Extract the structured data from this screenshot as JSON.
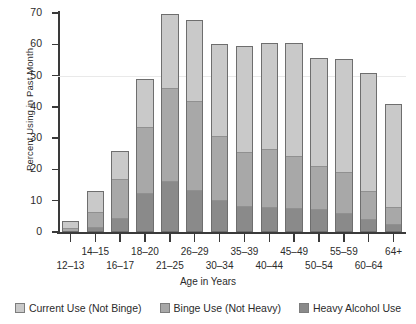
{
  "chart_data": {
    "type": "bar",
    "stacked": true,
    "title": "",
    "xlabel": "Age in Years",
    "ylabel": "Percent Using in Past Month",
    "ylim": [
      0,
      70
    ],
    "yticks": [
      0,
      10,
      20,
      30,
      40,
      50,
      60,
      70
    ],
    "grid": "horizontal gridline at 50",
    "legend_position": "bottom",
    "categories": [
      "12–13",
      "14–15",
      "16–17",
      "18–20",
      "21–25",
      "26–29",
      "30–34",
      "35–39",
      "40–44",
      "45–49",
      "50–54",
      "55–59",
      "60–64",
      "64+"
    ],
    "series": [
      {
        "name": "Heavy Alcohol Use",
        "color": "#8a8a8a",
        "values": [
          0.0,
          1.5,
          4.3,
          12.2,
          16.0,
          13.2,
          10.0,
          8.0,
          7.7,
          7.5,
          7.0,
          5.8,
          4.0,
          2.2
        ]
      },
      {
        "name": "Binge Use (Not Heavy)",
        "color": "#a8a8a8",
        "values": [
          1.3,
          5.0,
          12.6,
          21.6,
          30.2,
          28.9,
          20.8,
          17.5,
          18.7,
          16.8,
          14.0,
          13.2,
          9.0,
          5.6
        ]
      },
      {
        "name": "Current Use (Not Binge)",
        "color": "#c9c9c9",
        "values": [
          2.2,
          6.5,
          9.1,
          15.1,
          23.6,
          25.6,
          29.2,
          33.9,
          34.0,
          36.0,
          34.5,
          36.3,
          37.9,
          33.0
        ]
      }
    ],
    "totals": [
      3.5,
      13.0,
      26.0,
      48.9,
      69.8,
      67.7,
      60.0,
      59.4,
      60.4,
      60.3,
      55.5,
      55.3,
      50.9,
      40.8
    ]
  },
  "axis": {
    "y_title": "Percent Using in Past Month",
    "x_title": "Age in Years",
    "y_tick_labels": [
      "0",
      "10",
      "20",
      "30",
      "40",
      "50",
      "60",
      "70"
    ]
  },
  "legend": {
    "items": [
      {
        "label": "Current Use (Not Binge)",
        "color": "#c9c9c9"
      },
      {
        "label": "Binge Use (Not Heavy)",
        "color": "#a8a8a8"
      },
      {
        "label": "Heavy Alcohol Use",
        "color": "#8a8a8a"
      }
    ]
  }
}
